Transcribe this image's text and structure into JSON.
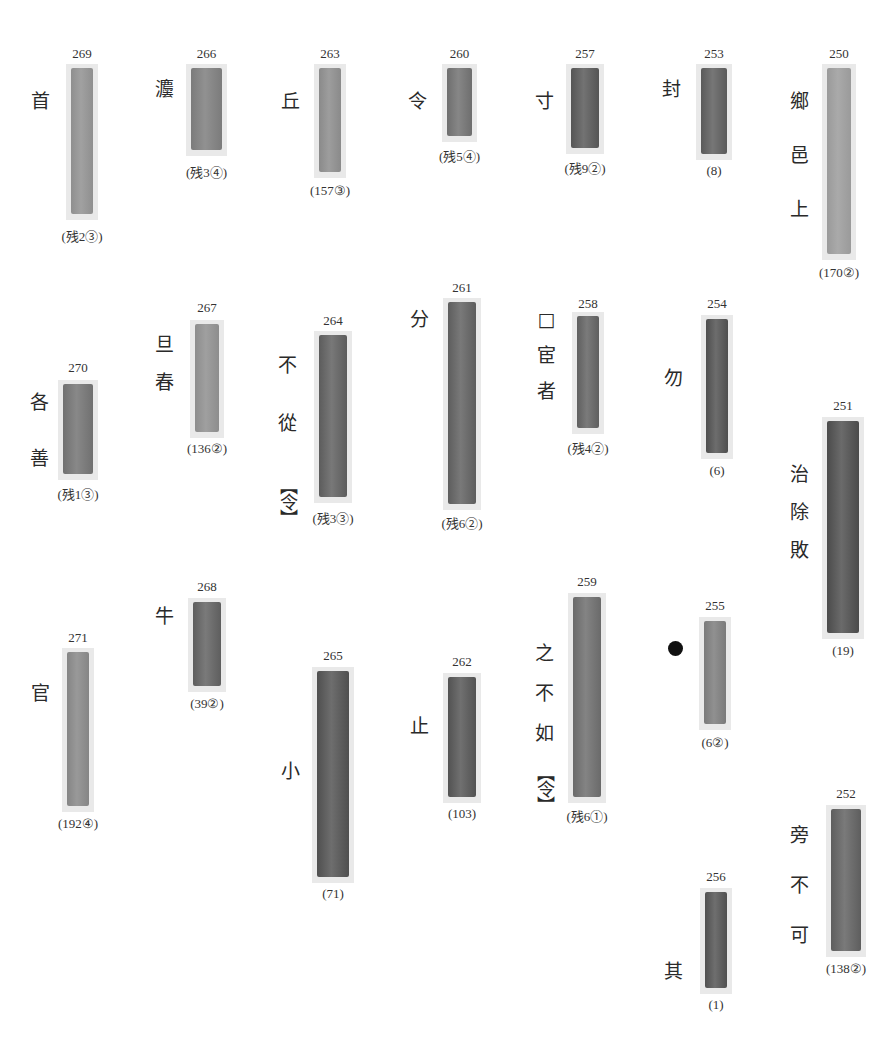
{
  "page": {
    "background": "#ffffff"
  },
  "slips": [
    {
      "id": "269",
      "caption": "(残2③)",
      "gloss": [
        "首"
      ],
      "x": 66,
      "y": 64,
      "w": 32,
      "h": 156,
      "shade": "#8f8f8f",
      "gx": 31,
      "gy": 92,
      "numY": 46,
      "capY": 226
    },
    {
      "id": "266",
      "caption": "(残3④)",
      "gloss": [
        "灋"
      ],
      "x": 186,
      "y": 64,
      "w": 41,
      "h": 92,
      "shade": "#7b7b7b",
      "gx": 155,
      "gy": 80,
      "numY": 46,
      "capY": 162
    },
    {
      "id": "263",
      "caption": "(157③)",
      "gloss": [
        "丘"
      ],
      "x": 314,
      "y": 64,
      "w": 32,
      "h": 114,
      "shade": "#8a8a8a",
      "gx": 281,
      "gy": 92,
      "numY": 46,
      "capY": 183
    },
    {
      "id": "260",
      "caption": "(残5④)",
      "gloss": [
        "令"
      ],
      "x": 442,
      "y": 64,
      "w": 35,
      "h": 78,
      "shade": "#6e6e6e",
      "gx": 408,
      "gy": 92,
      "numY": 46,
      "capY": 146
    },
    {
      "id": "257",
      "caption": "(残9②)",
      "gloss": [
        "寸"
      ],
      "x": 566,
      "y": 64,
      "w": 38,
      "h": 90,
      "shade": "#555555",
      "gx": 535,
      "gy": 92,
      "numY": 46,
      "capY": 158
    },
    {
      "id": "253",
      "caption": "(8)",
      "gloss": [
        "封"
      ],
      "x": 696,
      "y": 64,
      "w": 36,
      "h": 96,
      "shade": "#5a5a5a",
      "gx": 662,
      "gy": 80,
      "numY": 46,
      "capY": 163
    },
    {
      "id": "250",
      "caption": "(170②)",
      "gloss": [
        "鄉",
        "邑",
        "上"
      ],
      "x": 822,
      "y": 64,
      "w": 34,
      "h": 196,
      "shade": "#9a9a9a",
      "gx": 790,
      "gy": 92,
      "gstep": 54,
      "numY": 46,
      "capY": 265
    },
    {
      "id": "270",
      "caption": "(残1③)",
      "gloss": [
        "各",
        "善"
      ],
      "x": 58,
      "y": 380,
      "w": 40,
      "h": 100,
      "shade": "#707070",
      "gx": 30,
      "gy": 393,
      "gstep": 56,
      "numY": 360,
      "capY": 484
    },
    {
      "id": "267",
      "caption": "(136②)",
      "gloss": [
        "旦",
        "春"
      ],
      "x": 190,
      "y": 320,
      "w": 34,
      "h": 118,
      "shade": "#8d8d8d",
      "gx": 155,
      "gy": 335,
      "gstep": 38,
      "numY": 300,
      "capY": 441
    },
    {
      "id": "264",
      "caption": "(残3③)",
      "gloss": [
        "不",
        "從",
        "【令】"
      ],
      "x": 314,
      "y": 331,
      "w": 38,
      "h": 172,
      "shade": "#5c5c5c",
      "gx": 278,
      "gy": 356,
      "gstep": 58,
      "numY": 313,
      "capY": 508
    },
    {
      "id": "261",
      "caption": "(残6②)",
      "gloss": [
        "分"
      ],
      "x": 443,
      "y": 298,
      "w": 38,
      "h": 212,
      "shade": "#5d5d5d",
      "gx": 410,
      "gy": 310,
      "numY": 280,
      "capY": 513
    },
    {
      "id": "258",
      "caption": "(残4②)",
      "gloss": [
        "□",
        "宦",
        "者"
      ],
      "x": 572,
      "y": 312,
      "w": 32,
      "h": 122,
      "shade": "#5f5f5f",
      "gx": 537,
      "gy": 310,
      "gstep": 36,
      "numY": 296,
      "capY": 438
    },
    {
      "id": "254",
      "caption": "(6)",
      "gloss": [
        "勿"
      ],
      "x": 701,
      "y": 315,
      "w": 32,
      "h": 144,
      "shade": "#4e4e4e",
      "gx": 664,
      "gy": 369,
      "numY": 296,
      "capY": 463
    },
    {
      "id": "251",
      "caption": "(19)",
      "gloss": [
        "治",
        "除",
        "敗"
      ],
      "x": 822,
      "y": 417,
      "w": 42,
      "h": 222,
      "shade": "#4b4b4b",
      "gx": 790,
      "gy": 465,
      "gstep": 38,
      "numY": 398,
      "capY": 643
    },
    {
      "id": "271",
      "caption": "(192④)",
      "gloss": [
        "官"
      ],
      "x": 62,
      "y": 648,
      "w": 32,
      "h": 164,
      "shade": "#858585",
      "gx": 31,
      "gy": 684,
      "numY": 630,
      "capY": 816
    },
    {
      "id": "268",
      "caption": "(39②)",
      "gloss": [
        "牛"
      ],
      "x": 188,
      "y": 598,
      "w": 38,
      "h": 94,
      "shade": "#5e5e5e",
      "gx": 155,
      "gy": 607,
      "numY": 579,
      "capY": 696
    },
    {
      "id": "265",
      "caption": "(71)",
      "gloss": [
        "小"
      ],
      "x": 312,
      "y": 667,
      "w": 42,
      "h": 216,
      "shade": "#4f4f4f",
      "gx": 281,
      "gy": 762,
      "numY": 648,
      "capY": 886
    },
    {
      "id": "262",
      "caption": "(103)",
      "gloss": [
        "止"
      ],
      "x": 443,
      "y": 673,
      "w": 38,
      "h": 130,
      "shade": "#525252",
      "gx": 410,
      "gy": 717,
      "numY": 654,
      "capY": 806
    },
    {
      "id": "259",
      "caption": "(残6①)",
      "gloss": [
        "之",
        "不",
        "如",
        "【令】"
      ],
      "x": 568,
      "y": 593,
      "w": 38,
      "h": 210,
      "shade": "#6a6a6a",
      "gx": 535,
      "gy": 644,
      "gstep": 40,
      "numY": 574,
      "capY": 806
    },
    {
      "id": "255",
      "caption": "(6②)",
      "gloss": [
        "●"
      ],
      "x": 699,
      "y": 617,
      "w": 32,
      "h": 113,
      "shade": "#7a7a7a",
      "gx": 668,
      "gy": 641,
      "numY": 598,
      "capY": 735,
      "dot": true
    },
    {
      "id": "256",
      "caption": "(1)",
      "gloss": [
        "其"
      ],
      "x": 700,
      "y": 888,
      "w": 32,
      "h": 106,
      "shade": "#505050",
      "gx": 664,
      "gy": 962,
      "numY": 869,
      "capY": 997
    },
    {
      "id": "252",
      "caption": "(138②)",
      "gloss": [
        "旁",
        "不",
        "可"
      ],
      "x": 826,
      "y": 805,
      "w": 40,
      "h": 152,
      "shade": "#5e5e5e",
      "gx": 790,
      "gy": 826,
      "gstep": 50,
      "numY": 786,
      "capY": 961
    }
  ]
}
